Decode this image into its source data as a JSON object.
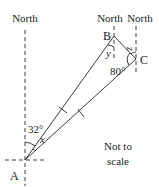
{
  "diagram": {
    "type": "bearings-triangle",
    "north_labels": [
      "North",
      "North",
      "North"
    ],
    "points": {
      "A": {
        "label": "A",
        "x": 25,
        "y": 160
      },
      "B": {
        "label": "B",
        "x": 114,
        "y": 36
      },
      "C": {
        "label": "C",
        "x": 136,
        "y": 59
      }
    },
    "angles": {
      "angle_A_north": "32°",
      "angle_A_x": "x",
      "angle_B_y": "y",
      "angle_C": "80°",
      "angle_C_z": "z"
    },
    "note_line1": "Not to",
    "note_line2": "scale",
    "equal_sides": [
      "AB",
      "AC"
    ],
    "colors": {
      "line": "#3a3a3a",
      "text": "#222222"
    }
  }
}
